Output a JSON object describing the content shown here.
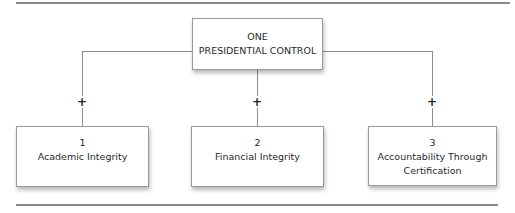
{
  "top": {
    "line1": "ONE",
    "line2": "PRESIDENTIAL CONTROL"
  },
  "connector_symbol": "+",
  "children": [
    {
      "number": "1",
      "label": "Academic Integrity",
      "label2": ""
    },
    {
      "number": "2",
      "label": "Financial Integrity",
      "label2": ""
    },
    {
      "number": "3",
      "label": "Accountability Through",
      "label2": "Certification"
    }
  ]
}
